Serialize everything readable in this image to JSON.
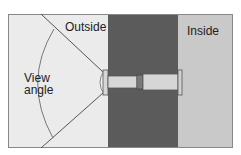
{
  "diagram": {
    "type": "door-peephole-cross-section",
    "labels": {
      "outside": "Outside",
      "inside": "Inside",
      "view_angle_line1": "View",
      "view_angle_line2": "angle"
    },
    "colors": {
      "outside_bg": "#ebebeb",
      "door": "#5b5b5b",
      "inside_bg": "#c9c9c9",
      "tube": "#d6d6d6",
      "stroke": "#555555",
      "frame": "#888888"
    },
    "regions": [
      {
        "name": "outside",
        "label": "Outside"
      },
      {
        "name": "door",
        "label": ""
      },
      {
        "name": "inside",
        "label": "Inside"
      }
    ],
    "components": [
      "outer-flange-lens",
      "outer-tube",
      "threaded-joint",
      "inner-tube",
      "inner-flange"
    ]
  }
}
